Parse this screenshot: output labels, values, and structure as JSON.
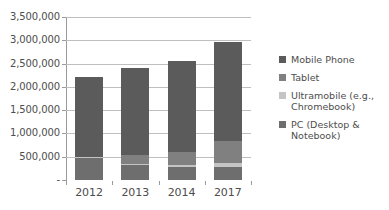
{
  "chart_data": {
    "type": "bar",
    "subtype": "stacked-bar",
    "title": "",
    "subtitle": "",
    "xlabel": "",
    "ylabel": "",
    "categories": [
      "2012",
      "2013",
      "2014",
      "2017"
    ],
    "ylim": [
      0,
      3500000
    ],
    "yticks": [
      0,
      500000,
      1000000,
      1500000,
      2000000,
      2500000,
      3000000,
      3500000
    ],
    "ytick_labels": [
      "-",
      "500,000",
      "1,000,000",
      "1,500,000",
      "2,000,000",
      "2,500,000",
      "3,000,000",
      "3,500,000"
    ],
    "grid": true,
    "legend_position": "right",
    "stack_order_bottom_to_top": [
      "PC (Desktop & Notebook)",
      "Ultramobile (e.g., Chromebook)",
      "Tablet",
      "Mobile Phone"
    ],
    "series": [
      {
        "name": "Mobile Phone",
        "color": "#5b5b5b",
        "values": [
          1710000,
          1870000,
          1950000,
          2130000
        ]
      },
      {
        "name": "Tablet",
        "color": "#808080",
        "values": [
          0,
          200000,
          280000,
          470000
        ]
      },
      {
        "name": "Ultramobile (e.g., Chromebook)",
        "color": "#c4c4c4",
        "values": [
          10000,
          20000,
          40000,
          90000
        ]
      },
      {
        "name": "PC (Desktop & Notebook)",
        "color": "#6e6e6e",
        "values": [
          490000,
          320000,
          280000,
          270000
        ]
      }
    ],
    "totals": [
      2210000,
      2410000,
      2550000,
      2960000
    ]
  },
  "axes": {
    "y_tick_labels": [
      {
        "text": "3,500,000",
        "value": 3500000
      },
      {
        "text": "3,000,000",
        "value": 3000000
      },
      {
        "text": "2,500,000",
        "value": 2500000
      },
      {
        "text": "2,000,000",
        "value": 2000000
      },
      {
        "text": "1,500,000",
        "value": 1500000
      },
      {
        "text": "1,000,000",
        "value": 1000000
      },
      {
        "text": "500,000",
        "value": 500000
      },
      {
        "text": "-",
        "value": 0
      }
    ],
    "x_tick_labels": [
      "2012",
      "2013",
      "2014",
      "2017"
    ]
  },
  "legend": {
    "items": [
      {
        "label": "Mobile Phone",
        "color": "#5b5b5b"
      },
      {
        "label": "Tablet",
        "color": "#808080"
      },
      {
        "label": "Ultramobile (e.g.,\nChromebook)",
        "color": "#c4c4c4"
      },
      {
        "label": "PC (Desktop &\nNotebook)",
        "color": "#6e6e6e"
      }
    ]
  },
  "colors": {
    "background": "#ffffff",
    "grid": "#bfbfbf",
    "axis": "#9a9a9a",
    "text": "#4d4d4d"
  }
}
